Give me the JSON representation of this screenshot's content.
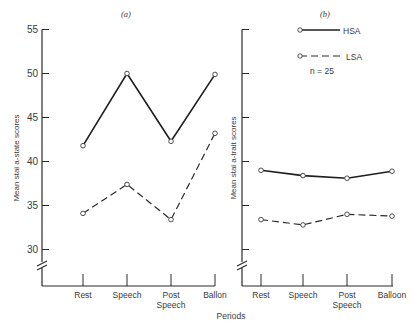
{
  "chart_data": [
    {
      "type": "line",
      "panel": "(a)",
      "title": "(a)",
      "xlabel": "Periods",
      "ylabel": "Mean stai a-state scores",
      "categories": [
        "Rest",
        "Speech",
        "Post Speech",
        "Ballon"
      ],
      "yticks": [
        30,
        35,
        40,
        45,
        50,
        55
      ],
      "ylim": [
        28,
        55
      ],
      "axis_break": true,
      "grid": false,
      "series": [
        {
          "name": "HSA",
          "style": "solid",
          "values": [
            41.8,
            50.0,
            42.3,
            49.9
          ]
        },
        {
          "name": "LSA",
          "style": "dashed",
          "values": [
            34.1,
            37.4,
            33.4,
            43.2
          ]
        }
      ]
    },
    {
      "type": "line",
      "panel": "(b)",
      "title": "(b)",
      "xlabel": "Periods",
      "ylabel": "Mean stai a-trait scores",
      "categories": [
        "Rest",
        "Speech",
        "Post Speech",
        "Balloon"
      ],
      "yticks": [
        30,
        35,
        40,
        45,
        50,
        55
      ],
      "ytick_labels_shown": false,
      "ylim": [
        28,
        55
      ],
      "axis_break": true,
      "grid": false,
      "legend": {
        "position": "top-right",
        "entries": [
          "HSA",
          "LSA"
        ],
        "note": "n = 25"
      },
      "series": [
        {
          "name": "HSA",
          "style": "solid",
          "values": [
            39.0,
            38.4,
            38.1,
            38.9
          ]
        },
        {
          "name": "LSA",
          "style": "dashed",
          "values": [
            33.4,
            32.8,
            34.0,
            33.8
          ]
        }
      ]
    }
  ],
  "labels": {
    "panel_a": "(a)",
    "panel_b": "(b)",
    "ylabel_a": "Mean stai a-state scores",
    "ylabel_b": "Mean stai a-trait scores",
    "xlabel": "Periods",
    "legend_hsa": "HSA",
    "legend_lsa": "LSA",
    "legend_n": "n = 25"
  }
}
